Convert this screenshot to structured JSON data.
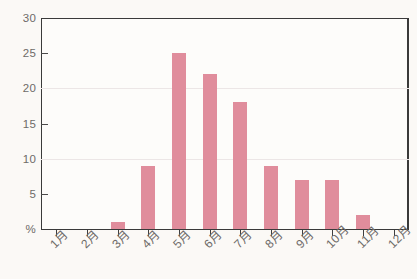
{
  "chart_data": {
    "type": "bar",
    "title": "",
    "xlabel": "",
    "ylabel": "%",
    "categories": [
      "1月",
      "2月",
      "3月",
      "4月",
      "5月",
      "6月",
      "7月",
      "8月",
      "9月",
      "10月",
      "11月",
      "12月"
    ],
    "values": [
      0,
      0,
      1,
      9,
      25,
      22,
      18,
      9,
      7,
      7,
      2,
      0
    ],
    "ylim": [
      0,
      30
    ],
    "ytick_labels": [
      "%",
      "5",
      "10",
      "15",
      "20",
      "25",
      "30"
    ],
    "ytick_values": [
      0,
      5,
      10,
      15,
      20,
      25,
      30
    ],
    "gridline_values": [
      10,
      20
    ],
    "grid": true,
    "legend": "none",
    "bar_color": "#e08d9c",
    "axis_color": "#3a3a3a",
    "grid_color": "#ece6e6",
    "tick_label_color": "#6e6b68",
    "background_color": "#fbf9f6"
  }
}
